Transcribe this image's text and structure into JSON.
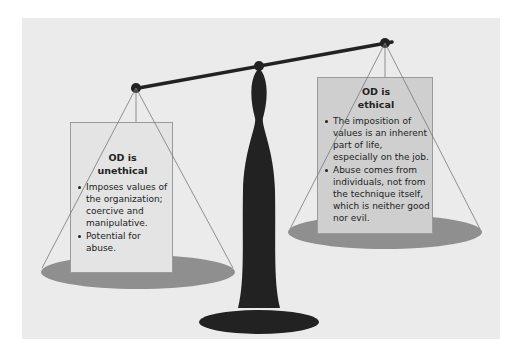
{
  "diagram": {
    "type": "balance-scale",
    "colors": {
      "background": "#ebebeb",
      "scale": "#222222",
      "pan": "#8f8f8f",
      "left_box": "#e4e4e4",
      "right_box": "#cfcfcf"
    },
    "left_pan": {
      "title_line1": "OD is",
      "title_line2": "unethical",
      "bullets": [
        "Imposes values of the organization; coercive and manipulative.",
        "Potential for abuse."
      ]
    },
    "right_pan": {
      "title_line1": "OD is",
      "title_line2": "ethical",
      "bullets": [
        "The imposition of values is an inherent part of life, especially on the job.",
        "Abuse comes from individuals, not from the technique itself, which is neither good nor evil."
      ]
    }
  }
}
